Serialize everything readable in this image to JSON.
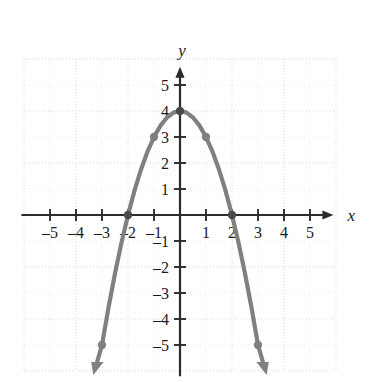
{
  "figure": {
    "name": "parabola-graph",
    "background_color": "#ffffff"
  },
  "chart_data": {
    "type": "line",
    "title": "",
    "xlabel": "x",
    "ylabel": "y",
    "xlim": [
      -6,
      6
    ],
    "ylim": [
      -6,
      6
    ],
    "grid": true,
    "grid_spacing": 1,
    "grid_major_spacing": 2,
    "legend": "none",
    "curve_color": "#808080",
    "axis_color": "#2b2b2b",
    "grid_color": "#d8d8d8",
    "equation": "y = -x^2 + 4",
    "series": [
      {
        "name": "parabola",
        "kind": "quadratic",
        "vertex": [
          0,
          4
        ],
        "a": -1,
        "x": [
          -3,
          -2.75,
          -2.5,
          -2.25,
          -2,
          -1.75,
          -1.5,
          -1.25,
          -1,
          -0.75,
          -0.5,
          -0.25,
          0,
          0.25,
          0.5,
          0.75,
          1,
          1.25,
          1.5,
          1.75,
          2,
          2.25,
          2.5,
          2.75,
          3
        ],
        "values": [
          -5,
          -3.5625,
          -2.25,
          -1.0625,
          0,
          0.9375,
          1.75,
          2.4375,
          3,
          3.4375,
          3.75,
          3.9375,
          4,
          3.9375,
          3.75,
          3.4375,
          3,
          2.4375,
          1.75,
          0.9375,
          0,
          -1.0625,
          -2.25,
          -3.5625,
          -5
        ],
        "endpoints_with_arrows": [
          [
            -3,
            -5
          ],
          [
            3,
            -5
          ]
        ]
      }
    ],
    "marked_points": [
      {
        "x": -3,
        "y": -5,
        "label": "left-endpoint"
      },
      {
        "x": -2,
        "y": 0,
        "label": "left-x-intercept"
      },
      {
        "x": -1,
        "y": 3,
        "label": "left-point"
      },
      {
        "x": 0,
        "y": 4,
        "label": "vertex"
      },
      {
        "x": 1,
        "y": 3,
        "label": "right-point"
      },
      {
        "x": 2,
        "y": 0,
        "label": "right-x-intercept"
      },
      {
        "x": 3,
        "y": -5,
        "label": "right-endpoint"
      }
    ],
    "x_ticks": [
      {
        "value": -5,
        "label": "–5"
      },
      {
        "value": -4,
        "label": "–4"
      },
      {
        "value": -3,
        "label": "–3"
      },
      {
        "value": -2,
        "label": "–2"
      },
      {
        "value": -1,
        "label": "–1"
      },
      {
        "value": 1,
        "label": "1"
      },
      {
        "value": 2,
        "label": "2"
      },
      {
        "value": 3,
        "label": "3"
      },
      {
        "value": 4,
        "label": "4"
      },
      {
        "value": 5,
        "label": "5"
      }
    ],
    "y_ticks": [
      {
        "value": 5,
        "label": "5"
      },
      {
        "value": 4,
        "label": "4"
      },
      {
        "value": 3,
        "label": "3"
      },
      {
        "value": 2,
        "label": "2"
      },
      {
        "value": 1,
        "label": "1"
      },
      {
        "value": -1,
        "label": "–1"
      },
      {
        "value": -2,
        "label": "–2"
      },
      {
        "value": -3,
        "label": "–3"
      },
      {
        "value": -4,
        "label": "–4"
      },
      {
        "value": -5,
        "label": "–5"
      }
    ],
    "axis_labels": {
      "x": "x",
      "y": "y"
    }
  }
}
